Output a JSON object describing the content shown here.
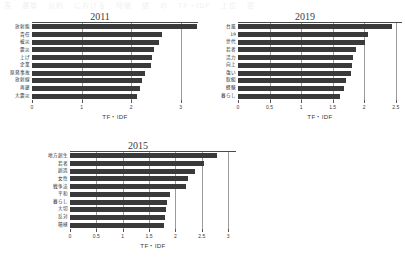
{
  "caption": {
    "fragments": [
      "表",
      "選挙",
      "公約",
      "における",
      "特徴",
      "語",
      "の",
      "TF・IDF",
      "上位",
      "語"
    ]
  },
  "axis_title": "TF・IDF",
  "bar_color": "#3a3a3a",
  "chart_data": [
    {
      "type": "bar",
      "orientation": "horizontal",
      "title": "2011",
      "xlabel": "TF・IDF",
      "ylabel": "",
      "xlim": [
        0,
        3.35
      ],
      "ticks": [
        0,
        1,
        2,
        3
      ],
      "tick_labels": [
        "0",
        "1",
        "2",
        "3"
      ],
      "grid": true,
      "categories": [
        "放射能",
        "責任",
        "被災",
        "震災",
        "上げ",
        "企業",
        "原発事故",
        "放射線",
        "再建",
        "大震災"
      ],
      "values": [
        3.32,
        2.62,
        2.56,
        2.46,
        2.42,
        2.4,
        2.28,
        2.22,
        2.18,
        2.12
      ]
    },
    {
      "type": "bar",
      "orientation": "horizontal",
      "title": "2019",
      "xlabel": "TF・IDF",
      "ylabel": "",
      "xlim": [
        0,
        2.6
      ],
      "ticks": [
        0,
        0.5,
        1,
        1.5,
        2,
        2.5
      ],
      "tick_labels": [
        "0",
        "0.5",
        "1",
        "1.5",
        "2",
        "2.5"
      ],
      "grid": true,
      "categories": [
        "台風",
        "19",
        "世代",
        "若者",
        "活力",
        "向上",
        "強い",
        "取組",
        "経験",
        "暮らし"
      ],
      "values": [
        2.44,
        2.06,
        2.02,
        1.87,
        1.82,
        1.81,
        1.79,
        1.72,
        1.68,
        1.62
      ]
    },
    {
      "type": "bar",
      "orientation": "horizontal",
      "title": "2015",
      "xlabel": "TF・IDF",
      "ylabel": "",
      "xlim": [
        0,
        3.15
      ],
      "ticks": [
        0,
        0.5,
        1,
        1.5,
        2,
        2.5,
        3
      ],
      "tick_labels": [
        "0",
        "0.5",
        "1",
        "1.5",
        "2",
        "2.5",
        "3"
      ],
      "grid": true,
      "categories": [
        "地方創生",
        "若者",
        "創造",
        "女性",
        "戦争法",
        "平和",
        "暮らし",
        "大切",
        "反対",
        "積極"
      ],
      "values": [
        2.79,
        2.55,
        2.38,
        2.24,
        2.2,
        1.9,
        1.84,
        1.82,
        1.8,
        1.78
      ]
    }
  ]
}
